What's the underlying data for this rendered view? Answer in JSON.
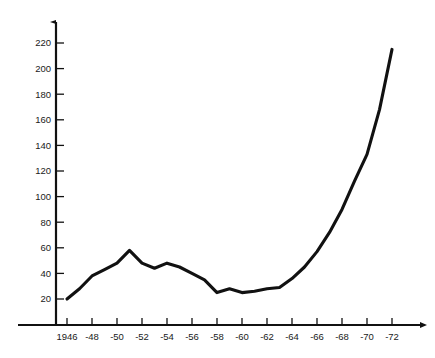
{
  "chart_data": {
    "type": "line",
    "title": "",
    "subtitle": "",
    "xlabel": "",
    "ylabel": "",
    "xlim": [
      1946,
      1973
    ],
    "ylim": [
      0,
      230
    ],
    "grid": false,
    "legend": null,
    "legend_position": "none",
    "x_tick_labels": [
      "1946",
      "-48",
      "-50",
      "-52",
      "-54",
      "-56",
      "-58",
      "-60",
      "-62",
      "-64",
      "-66",
      "-68",
      "-70",
      "-72"
    ],
    "x_tick_values": [
      1946,
      1948,
      1950,
      1952,
      1954,
      1956,
      1958,
      1960,
      1962,
      1964,
      1966,
      1968,
      1970,
      1972
    ],
    "y_tick_labels": [
      "20",
      "40",
      "60",
      "80",
      "100",
      "120",
      "140",
      "160",
      "180",
      "200",
      "220"
    ],
    "y_tick_values": [
      20,
      40,
      60,
      80,
      100,
      120,
      140,
      160,
      180,
      200,
      220
    ],
    "x": [
      1946,
      1947,
      1948,
      1949,
      1950,
      1951,
      1952,
      1953,
      1954,
      1955,
      1956,
      1957,
      1958,
      1959,
      1960,
      1961,
      1962,
      1963,
      1964,
      1965,
      1966,
      1967,
      1968,
      1969,
      1970,
      1971,
      1972
    ],
    "values": [
      20,
      28,
      38,
      43,
      48,
      58,
      48,
      44,
      48,
      45,
      40,
      35,
      25,
      28,
      25,
      26,
      28,
      29,
      36,
      45,
      57,
      72,
      90,
      112,
      133,
      168,
      215
    ],
    "series": [
      {
        "name": "series-1",
        "color": "#111111",
        "values": [
          20,
          28,
          38,
          43,
          48,
          58,
          48,
          44,
          48,
          45,
          40,
          35,
          25,
          28,
          25,
          26,
          28,
          29,
          36,
          45,
          57,
          72,
          90,
          112,
          133,
          168,
          215
        ]
      }
    ],
    "axis_color": "#111111",
    "line_color": "#111111",
    "background_color": "#ffffff",
    "x_axis_arrow": true,
    "y_axis_arrow": true
  }
}
